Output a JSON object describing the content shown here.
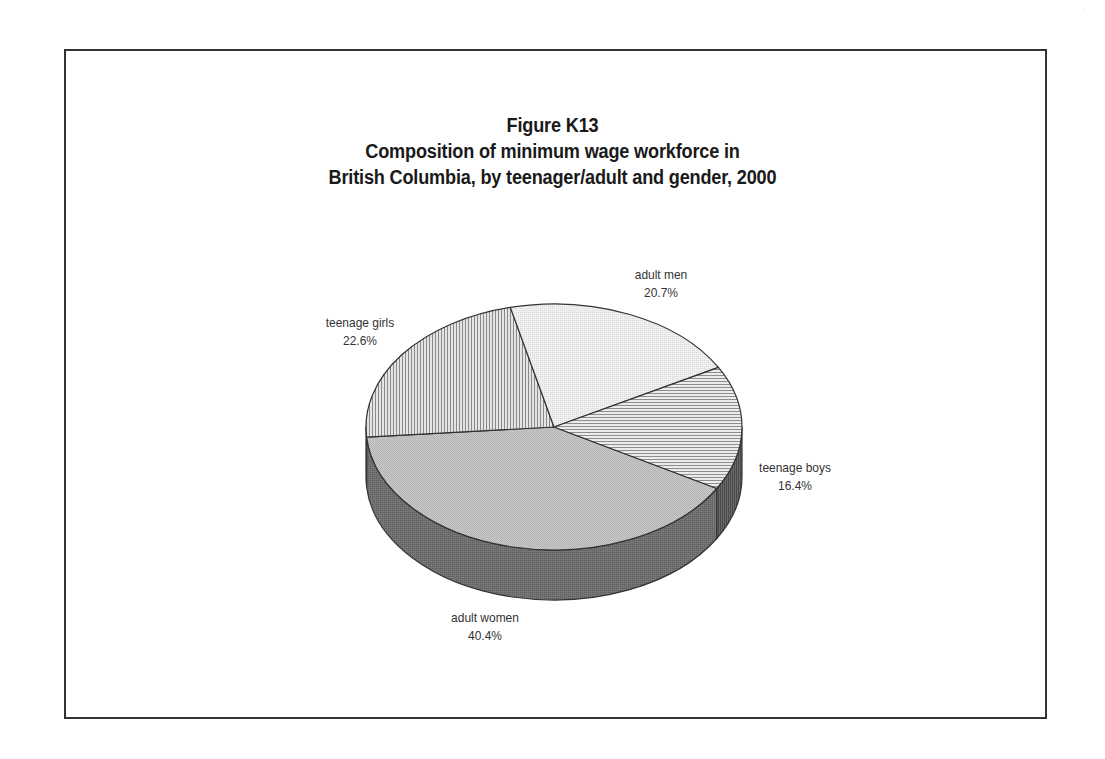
{
  "figure": {
    "title_lines": [
      "Figure K13",
      "Composition of minimum wage workforce in",
      "British Columbia, by teenager/adult and gender, 2000"
    ]
  },
  "chart_data": {
    "type": "pie",
    "style": "3d",
    "categories": [
      "adult women",
      "teenage girls",
      "adult men",
      "teenage boys"
    ],
    "values": [
      40.4,
      22.6,
      20.7,
      16.4
    ],
    "unit": "%",
    "slices": [
      {
        "label": "adult women",
        "value": 40.4,
        "display": "40.4%",
        "fill": "#c4c4c4",
        "side": "#6e6e6e",
        "pattern": "stipple"
      },
      {
        "label": "teenage girls",
        "value": 22.6,
        "display": "22.6%",
        "fill": "#d6d6d6",
        "side": "#6e6e6e",
        "pattern": "vertical-lines"
      },
      {
        "label": "adult men",
        "value": 20.7,
        "display": "20.7%",
        "fill": "#ececec",
        "side": "#6e6e6e",
        "pattern": "light-stipple"
      },
      {
        "label": "teenage boys",
        "value": 16.4,
        "display": "16.4%",
        "fill": "#e2e2e2",
        "side": "#5e5e5e",
        "pattern": "horizontal-lines"
      }
    ],
    "start_angle_deg": 30,
    "legend": "none (direct slice labels)",
    "grid": false
  },
  "labels": {
    "adult_women": {
      "name": "adult women",
      "pct": "40.4%"
    },
    "teenage_girls": {
      "name": "teenage girls",
      "pct": "22.6%"
    },
    "adult_men": {
      "name": "adult men",
      "pct": "20.7%"
    },
    "teenage_boys": {
      "name": "teenage boys",
      "pct": "16.4%"
    }
  },
  "colors": {
    "border": "#333333",
    "outline": "#333333",
    "text": "#222222"
  }
}
